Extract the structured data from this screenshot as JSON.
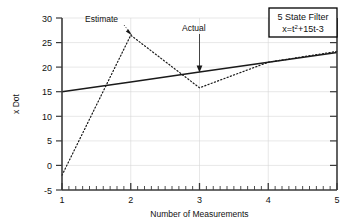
{
  "chart_data": {
    "type": "line",
    "title": "",
    "xlabel": "Number of Measurements",
    "ylabel": "x Dot",
    "xlim": [
      1,
      5
    ],
    "ylim": [
      -5,
      30
    ],
    "xticks": [
      1,
      2,
      3,
      4,
      5
    ],
    "yticks": [
      -5,
      0,
      5,
      10,
      15,
      20,
      25,
      30
    ],
    "xtick_labels": [
      "1",
      "2",
      "3",
      "4",
      "5"
    ],
    "ytick_labels": [
      "-5",
      "0",
      "5",
      "10",
      "15",
      "20",
      "25",
      "30"
    ],
    "grid": true,
    "minor_ticks": true,
    "minor_ticks_per_major_x": 10,
    "legend_position": "top-right",
    "x": [
      1,
      2,
      3,
      4,
      5
    ],
    "series": [
      {
        "name": "Actual",
        "style": "solid",
        "color": "#1a1a1a",
        "values": [
          15.0,
          17.0,
          19.0,
          21.0,
          23.0
        ]
      },
      {
        "name": "Estimate",
        "style": "dotted",
        "color": "#1a1a1a",
        "values": [
          -2.0,
          26.5,
          15.8,
          21.0,
          23.2
        ]
      }
    ],
    "annotations": [
      {
        "text": "Estimate",
        "label_x": 1.3,
        "label_y": 29.0,
        "point_x": 2.0,
        "point_y": 26.5
      },
      {
        "text": "Actual",
        "label_x": 2.75,
        "label_y": 27.5,
        "point_x": 3.0,
        "point_y": 19.0
      }
    ]
  },
  "legend": {
    "line1": "5 State Filter",
    "formula_prefix": "x=t",
    "formula_sup": "2",
    "formula_suffix": "+15t-3"
  },
  "colors": {
    "axis": "#3a3a3a",
    "grid": "#d0d0d0",
    "series": "#1a1a1a",
    "background": "#ffffff",
    "legend_border": "#000000"
  }
}
